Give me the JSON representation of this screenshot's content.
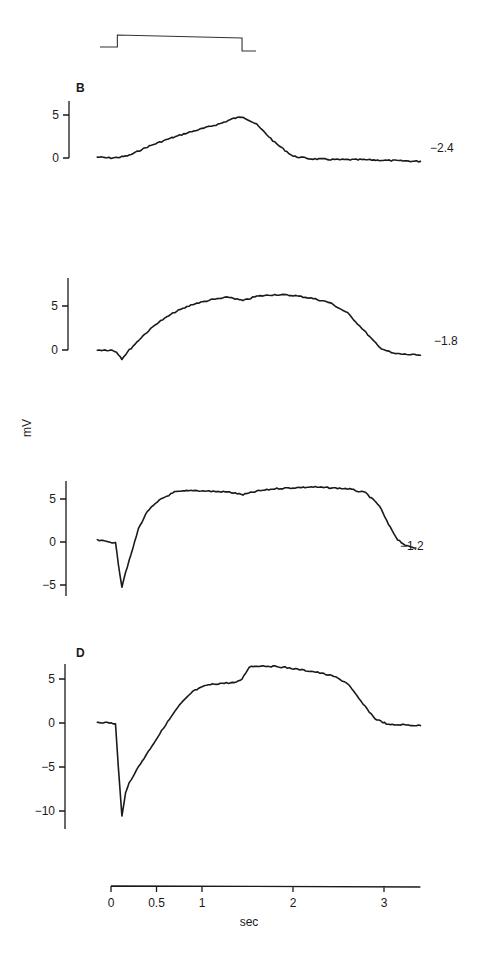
{
  "chart_data": {
    "type": "line",
    "title": "",
    "ylabel": "mV",
    "xlabel": "sec",
    "x_ticks": [
      "0",
      "0.5",
      "1",
      "2",
      "3"
    ],
    "x_tick_values": [
      0,
      0.5,
      1,
      2,
      3
    ],
    "xlim": [
      0,
      3.4
    ],
    "stimulus": {
      "description": "step pulse",
      "on_sec": 0.07,
      "off_sec": 1.44
    },
    "panels": [
      {
        "letter": "B",
        "trace_label": "-2.4",
        "y_ticks": [
          "5",
          "0"
        ],
        "y_tick_values": [
          5,
          0
        ],
        "ylim": [
          0,
          6.6
        ],
        "x": [
          -0.15,
          0.0,
          0.1,
          0.2,
          0.4,
          0.6,
          0.8,
          1.0,
          1.2,
          1.35,
          1.45,
          1.6,
          1.8,
          2.0,
          2.2,
          2.5,
          2.8,
          3.1,
          3.4
        ],
        "y": [
          0.1,
          0.0,
          0.1,
          0.3,
          1.3,
          2.1,
          2.8,
          3.4,
          4.0,
          4.6,
          4.8,
          3.9,
          1.8,
          0.2,
          -0.1,
          -0.2,
          -0.2,
          -0.3,
          -0.4
        ]
      },
      {
        "letter": "",
        "trace_label": "-1.8",
        "y_ticks": [
          "5",
          "0"
        ],
        "y_tick_values": [
          5,
          0
        ],
        "ylim": [
          0,
          8.3
        ],
        "x": [
          -0.15,
          0.0,
          0.06,
          0.12,
          0.2,
          0.35,
          0.5,
          0.7,
          0.9,
          1.1,
          1.3,
          1.45,
          1.6,
          1.8,
          2.0,
          2.2,
          2.4,
          2.6,
          2.8,
          2.95,
          3.1,
          3.25,
          3.4
        ],
        "y": [
          0.0,
          0.0,
          -0.2,
          -1.0,
          0.0,
          1.6,
          3.0,
          4.3,
          5.2,
          5.7,
          6.0,
          5.6,
          6.1,
          6.3,
          6.2,
          5.9,
          5.4,
          4.2,
          2.0,
          0.3,
          -0.4,
          -0.5,
          -0.6
        ]
      },
      {
        "letter": "",
        "trace_label": "-1.2",
        "y_ticks": [
          "5",
          "0",
          "-5"
        ],
        "y_tick_values": [
          5,
          0,
          -5
        ],
        "ylim": [
          -6.3,
          7.0
        ],
        "x": [
          -0.15,
          0.0,
          0.05,
          0.08,
          0.12,
          0.16,
          0.22,
          0.3,
          0.4,
          0.55,
          0.7,
          0.9,
          1.1,
          1.3,
          1.45,
          1.6,
          1.8,
          2.0,
          2.2,
          2.4,
          2.6,
          2.8,
          2.95,
          3.05,
          3.15,
          3.25,
          3.35
        ],
        "y": [
          0.2,
          0.0,
          -0.1,
          -2.5,
          -5.2,
          -3.5,
          -1.5,
          1.5,
          3.6,
          5.0,
          5.8,
          6.0,
          5.9,
          5.8,
          5.5,
          5.9,
          6.2,
          6.3,
          6.4,
          6.3,
          6.2,
          5.7,
          4.2,
          2.0,
          0.3,
          -0.5,
          -0.7
        ]
      },
      {
        "letter": "D",
        "trace_label": "",
        "y_ticks": [
          "5",
          "0",
          "-5",
          "-10"
        ],
        "y_tick_values": [
          5,
          0,
          -5,
          -10
        ],
        "ylim": [
          -12.0,
          7.0
        ],
        "x": [
          -0.15,
          0.0,
          0.05,
          0.08,
          0.12,
          0.16,
          0.2,
          0.3,
          0.45,
          0.6,
          0.75,
          0.9,
          1.05,
          1.2,
          1.38,
          1.44,
          1.52,
          1.65,
          1.85,
          2.05,
          2.25,
          2.45,
          2.6,
          2.75,
          2.9,
          3.05,
          3.2,
          3.4
        ],
        "y": [
          0.1,
          0.0,
          -0.1,
          -5.0,
          -10.5,
          -8.0,
          -6.8,
          -5.0,
          -2.6,
          -0.2,
          2.0,
          3.6,
          4.3,
          4.5,
          4.6,
          5.0,
          6.4,
          6.5,
          6.4,
          6.1,
          5.8,
          5.3,
          4.5,
          2.4,
          0.5,
          -0.2,
          -0.2,
          -0.3
        ]
      }
    ],
    "grid": false,
    "legend": "none"
  }
}
